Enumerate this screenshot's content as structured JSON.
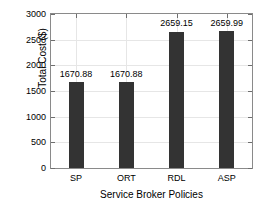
{
  "chart_data": {
    "type": "bar",
    "title": "",
    "xlabel": "Service Broker Policies",
    "ylabel": "Total Cost ($)",
    "categories": [
      "SP",
      "ORT",
      "RDL",
      "ASP"
    ],
    "values": [
      1670.88,
      1670.88,
      2659.15,
      2659.99
    ],
    "value_labels": [
      "1670.88",
      "1670.88",
      "2659.15",
      "2659.99"
    ],
    "ylim": [
      0,
      3000
    ],
    "yticks": [
      0,
      500,
      1000,
      1500,
      2000,
      2500,
      3000
    ],
    "ytick_labels": [
      "0",
      "500",
      "1000",
      "1500",
      "2000",
      "2500",
      "3000"
    ],
    "grid": true,
    "legend": null,
    "bar_color": "#333333",
    "background_color": "#ffffff",
    "axis_color": "#8a8a8a",
    "grid_color": "#e6e6e6"
  }
}
